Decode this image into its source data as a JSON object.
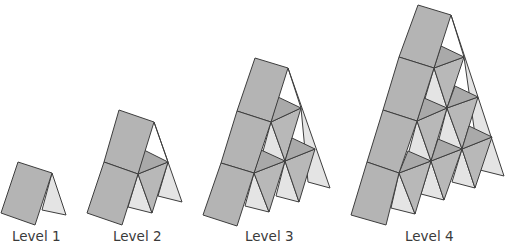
{
  "colors": {
    "front_card": "#b4b4b4",
    "back_triangle": "#e4e4e4",
    "shelf_card": "#a9a9a9",
    "mid_card": "#b8b8b8",
    "stroke": "#3d3d3d",
    "label": "#3a3a3a"
  },
  "labels": [
    {
      "text": "Level 1",
      "x": 12
    },
    {
      "text": "Level 2",
      "x": 113
    },
    {
      "text": "Level 3",
      "x": 245
    },
    {
      "text": "Level 4",
      "x": 405
    }
  ],
  "levels": [
    {
      "name": "level-1",
      "shapes": [
        {
          "k": "back",
          "p": "52,173 66,215 42,210"
        },
        {
          "k": "front",
          "p": "18,162 52,173 35,225 1,213"
        }
      ]
    },
    {
      "name": "level-2",
      "shapes": [
        {
          "k": "back",
          "p": "154,122 182,202 158,196 168,162"
        },
        {
          "k": "back",
          "p": "138,174 152,213 128,207"
        },
        {
          "k": "mid",
          "p": "168,162 152,213 138,174"
        },
        {
          "k": "shelf",
          "p": "144,150 168,162 138,174"
        },
        {
          "k": "front",
          "p": "119,110 154,122 138,174 104,162"
        },
        {
          "k": "front",
          "p": "104,162 138,174 122,225 87,213"
        }
      ]
    },
    {
      "name": "level-3",
      "shapes": [
        {
          "k": "back",
          "p": "288,68 330,188 308,182 301,108"
        },
        {
          "k": "back",
          "p": "271,122 285,161 262,155"
        },
        {
          "k": "back",
          "p": "254,173 269,212 245,206"
        },
        {
          "k": "back",
          "p": "285,161 299,202 276,196"
        },
        {
          "k": "mid",
          "p": "301,108 285,161 271,122"
        },
        {
          "k": "mid",
          "p": "315,149 299,202 285,161"
        },
        {
          "k": "mid",
          "p": "285,161 269,212 254,173"
        },
        {
          "k": "shelf",
          "p": "278,97 301,108 271,122"
        },
        {
          "k": "shelf",
          "p": "292,138 315,149 285,161"
        },
        {
          "k": "shelf",
          "p": "261,150 285,161 254,173"
        },
        {
          "k": "front",
          "p": "255,58 288,68 271,122 237,111"
        },
        {
          "k": "front",
          "p": "237,111 271,122 254,173 221,163"
        },
        {
          "k": "front",
          "p": "221,163 254,173 237,226 203,215"
        }
      ]
    },
    {
      "name": "level-4",
      "shapes": [
        {
          "k": "back",
          "p": "451,15 504,176 480,170 464,57"
        },
        {
          "k": "back",
          "p": "434,68 447,108 424,102"
        },
        {
          "k": "back",
          "p": "417,121 431,161 408,155"
        },
        {
          "k": "back",
          "p": "399,173 415,214 391,208"
        },
        {
          "k": "back",
          "p": "447,108 462,149 438,143"
        },
        {
          "k": "back",
          "p": "431,161 444,200 421,194"
        },
        {
          "k": "back",
          "p": "462,149 475,188 452,182"
        },
        {
          "k": "mid",
          "p": "464,57 447,108 434,68"
        },
        {
          "k": "mid",
          "p": "478,97 462,149 447,108"
        },
        {
          "k": "mid",
          "p": "492,137 475,188 462,149"
        },
        {
          "k": "mid",
          "p": "447,108 431,161 417,121"
        },
        {
          "k": "mid",
          "p": "462,149 444,200 431,161"
        },
        {
          "k": "mid",
          "p": "431,161 415,214 399,173"
        },
        {
          "k": "shelf",
          "p": "441,46 464,57 434,68"
        },
        {
          "k": "shelf",
          "p": "455,86 478,97 447,108"
        },
        {
          "k": "shelf",
          "p": "469,126 492,137 462,149"
        },
        {
          "k": "shelf",
          "p": "424,98 447,108 417,121"
        },
        {
          "k": "shelf",
          "p": "438,139 462,149 431,161"
        },
        {
          "k": "shelf",
          "p": "408,151 431,161 399,173"
        },
        {
          "k": "front",
          "p": "418,5 451,15 434,68 399,57"
        },
        {
          "k": "front",
          "p": "399,57 434,68 417,121 383,110"
        },
        {
          "k": "front",
          "p": "383,110 417,121 399,173 367,162"
        },
        {
          "k": "front",
          "p": "367,162 399,173 386,225 351,215"
        }
      ]
    }
  ]
}
